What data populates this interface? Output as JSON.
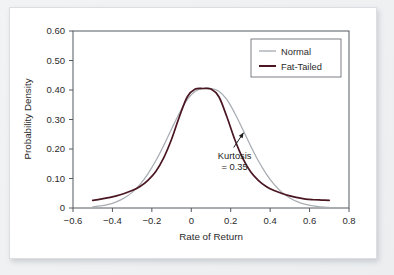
{
  "figure": {
    "background_color": "#eceef0",
    "panel_color": "#ffffff",
    "axis_color": "#555a60"
  },
  "chart_data": {
    "type": "line",
    "title": "",
    "xlabel": "Rate of Return",
    "ylabel": "Probability Density",
    "xlim": [
      -0.6,
      0.8
    ],
    "ylim": [
      0.0,
      0.6
    ],
    "xticks": [
      -0.6,
      -0.4,
      -0.2,
      0,
      0.2,
      0.4,
      0.6,
      0.8
    ],
    "xticklabels": [
      "−0.6",
      "−0.4",
      "−0.2",
      "0",
      "0.2",
      "0.4",
      "0.6",
      "0.8"
    ],
    "yticks": [
      0,
      0.1,
      0.2,
      0.3,
      0.4,
      0.5,
      0.6
    ],
    "yticklabels": [
      "0",
      "0.10",
      "0.20",
      "0.30",
      "0.40",
      "0.50",
      "0.60"
    ],
    "grid": false,
    "legend_position": "top-right",
    "series": [
      {
        "name": "Normal",
        "color": "#a9aeb4",
        "linewidth": 1.3,
        "x": [
          -0.5,
          -0.46,
          -0.42,
          -0.38,
          -0.34,
          -0.3,
          -0.26,
          -0.22,
          -0.18,
          -0.14,
          -0.1,
          -0.06,
          -0.02,
          0.02,
          0.06,
          0.1,
          0.14,
          0.18,
          0.22,
          0.26,
          0.3,
          0.34,
          0.38,
          0.42,
          0.46,
          0.5,
          0.54,
          0.58,
          0.62,
          0.66,
          0.7
        ],
        "y": [
          0.004,
          0.007,
          0.012,
          0.021,
          0.034,
          0.053,
          0.08,
          0.116,
          0.16,
          0.212,
          0.268,
          0.322,
          0.368,
          0.396,
          0.405,
          0.405,
          0.396,
          0.368,
          0.322,
          0.268,
          0.212,
          0.16,
          0.116,
          0.08,
          0.053,
          0.034,
          0.021,
          0.012,
          0.007,
          0.004,
          0.002
        ]
      },
      {
        "name": "Fat-Tailed",
        "color": "#4a1622",
        "linewidth": 1.7,
        "x": [
          -0.5,
          -0.46,
          -0.42,
          -0.38,
          -0.34,
          -0.3,
          -0.26,
          -0.22,
          -0.18,
          -0.14,
          -0.1,
          -0.06,
          -0.02,
          0.02,
          0.06,
          0.1,
          0.14,
          0.18,
          0.22,
          0.26,
          0.3,
          0.34,
          0.38,
          0.42,
          0.46,
          0.5,
          0.54,
          0.58,
          0.62,
          0.66,
          0.7
        ],
        "y": [
          0.026,
          0.03,
          0.035,
          0.041,
          0.049,
          0.059,
          0.073,
          0.094,
          0.124,
          0.17,
          0.233,
          0.31,
          0.377,
          0.403,
          0.405,
          0.403,
          0.377,
          0.31,
          0.233,
          0.17,
          0.124,
          0.094,
          0.073,
          0.059,
          0.049,
          0.041,
          0.035,
          0.03,
          0.028,
          0.027,
          0.026
        ]
      }
    ],
    "annotations": [
      {
        "name": "kurtosis",
        "line1": "Kurtosis",
        "line2": "= 0.35",
        "text_x": 0.22,
        "text_y": 0.165,
        "arrow_from_x": 0.215,
        "arrow_from_y": 0.205,
        "arrow_to_x": 0.265,
        "arrow_to_y": 0.255
      }
    ]
  }
}
